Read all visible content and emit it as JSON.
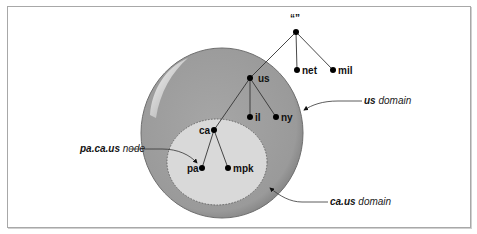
{
  "diagram": {
    "root_label": "“”",
    "nodes": {
      "net": "net",
      "mil": "mil",
      "us": "us",
      "il": "il",
      "ny": "ny",
      "ca": "ca",
      "pa": "pa",
      "mpk": "mpk"
    },
    "callouts": {
      "us_domain": {
        "bold": "us",
        "text": " domain"
      },
      "ca_us_domain": {
        "bold": "ca.us",
        "text": " domain"
      },
      "pa_ca_us_node": {
        "bold": "pa.ca.us",
        "text": " node"
      }
    },
    "colors": {
      "outer_domain": "#9d9d9d",
      "inner_domain": "#d9d9d9",
      "line": "#333333",
      "frame": "#a8a8a8"
    }
  }
}
